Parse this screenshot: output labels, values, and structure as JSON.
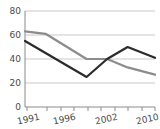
{
  "chart_data": {
    "type": "line",
    "title": "",
    "subtitle": "",
    "xlabel": "",
    "ylabel": "",
    "xlim": [
      1991,
      2010
    ],
    "ylim": [
      0,
      80
    ],
    "grid": true,
    "legend": "none",
    "y_ticks": [
      0,
      20,
      40,
      60,
      80
    ],
    "y_tick_labels": [
      "0",
      "20",
      "40",
      "60",
      "80"
    ],
    "x_ticks": [
      1991,
      1994,
      1996,
      1998,
      2000,
      2002,
      2004,
      2006,
      2008,
      2010
    ],
    "x_tick_labels_shown": [
      "1991",
      "1996",
      "2002",
      "2010"
    ],
    "x_label_positions": [
      1991,
      1996,
      2002,
      2010
    ],
    "series": [
      {
        "name": "gray-series",
        "color": "#8c8c8c",
        "x": [
          1991,
          1994,
          2000,
          2003,
          2006,
          2010
        ],
        "values": [
          63,
          61,
          40,
          40,
          33,
          27
        ]
      },
      {
        "name": "dark-series",
        "color": "#2b2b2b",
        "x": [
          1991,
          2000,
          2003,
          2006,
          2010
        ],
        "values": [
          55,
          25,
          40,
          50,
          41
        ]
      }
    ],
    "colors": {
      "gridline": "#c9c9c9",
      "axis": "#8a8a8a",
      "tick_text": "#4a4a4a",
      "background": "#ffffff"
    }
  }
}
